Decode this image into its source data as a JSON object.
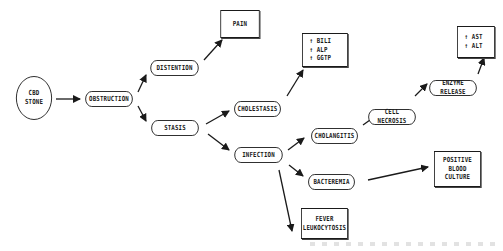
{
  "diagram": {
    "nodes": {
      "cbd_stone": {
        "line1": "CBD",
        "line2": "STONE"
      },
      "obstruction": {
        "label": "OBSTRUCTION"
      },
      "distention": {
        "label": "DISTENTION"
      },
      "pain": {
        "label": "PAIN"
      },
      "stasis": {
        "label": "STASIS"
      },
      "cholestasis": {
        "label": "CHOLESTASIS"
      },
      "labs_chol": {
        "line1": "↑ BILI",
        "line2": "↑ ALP",
        "line3": "↑ GGTP"
      },
      "infection": {
        "label": "INFECTION"
      },
      "cholangitis": {
        "label": "CHOLANGITIS"
      },
      "cell_necrosis": {
        "label": "CELL NECROSIS"
      },
      "enzyme_release": {
        "label": "ENZYME RELEASE"
      },
      "labs_enzyme": {
        "line1": "↑ AST",
        "line2": "↑ ALT"
      },
      "bacteremia": {
        "label": "BACTEREMIA"
      },
      "positive_blood_culture": {
        "line1": "POSITIVE",
        "line2": "BLOOD",
        "line3": "CULTURE"
      },
      "fever": {
        "line1": "FEVER",
        "line2": "LEUKOCYTOSIS"
      }
    },
    "edges": [
      {
        "from": "cbd_stone",
        "to": "obstruction"
      },
      {
        "from": "obstruction",
        "to": "distention"
      },
      {
        "from": "obstruction",
        "to": "stasis"
      },
      {
        "from": "distention",
        "to": "pain"
      },
      {
        "from": "stasis",
        "to": "cholestasis"
      },
      {
        "from": "stasis",
        "to": "infection"
      },
      {
        "from": "cholestasis",
        "to": "labs_chol"
      },
      {
        "from": "infection",
        "to": "cholangitis"
      },
      {
        "from": "infection",
        "to": "bacteremia"
      },
      {
        "from": "infection",
        "to": "fever"
      },
      {
        "from": "cholangitis",
        "to": "cell_necrosis"
      },
      {
        "from": "cell_necrosis",
        "to": "enzyme_release"
      },
      {
        "from": "enzyme_release",
        "to": "labs_enzyme"
      },
      {
        "from": "bacteremia",
        "to": "positive_blood_culture"
      }
    ],
    "colors": {
      "stroke": "#1a1a1a",
      "background": "#ffffff"
    }
  }
}
